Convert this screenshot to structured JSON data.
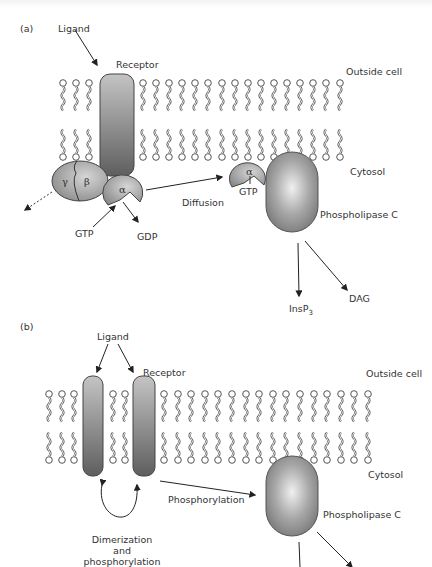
{
  "panel_a": {
    "label": "(a)",
    "ligand": "Ligand",
    "receptor": "Receptor",
    "outside_cell": "Outside cell",
    "cytosol": "Cytosol",
    "gamma": "γ",
    "beta": "β",
    "alpha": "α",
    "alpha_diffused": "α",
    "gtp": "GTP",
    "gdp": "GDP",
    "gtp_bound": "GTP",
    "diffusion": "Diffusion",
    "phospholipase": "Phospholipase C",
    "insp3_base": "InsP",
    "insp3_sub": "3",
    "dag": "DAG"
  },
  "panel_b": {
    "label": "(b)",
    "ligand": "Ligand",
    "receptor": "Receptor",
    "outside_cell": "Outside cell",
    "cytosol": "Cytosol",
    "phosphorylation": "Phosphorylation",
    "phospholipase": "Phospholipase C",
    "dimerization_line1": "Dimerization",
    "dimerization_line2": "and",
    "dimerization_line3": "phosphorylation"
  },
  "colors": {
    "protein_dark": "#6e6e6e",
    "protein_light": "#d8d8d8",
    "lipid": "#555555",
    "arrow": "#222222",
    "text": "#333333"
  }
}
